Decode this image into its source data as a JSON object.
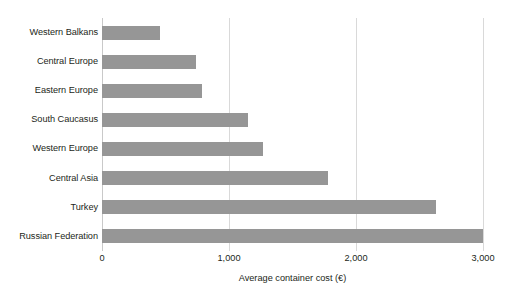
{
  "chart_data": {
    "type": "bar",
    "orientation": "horizontal",
    "title": "",
    "subtitle": "",
    "xlabel": "Average container cost (€)",
    "ylabel": "",
    "categories": [
      "Western Balkans",
      "Central Europe",
      "Eastern Europe",
      "South Caucasus",
      "Western Europe",
      "Central Asia",
      "Turkey",
      "Russian Federation"
    ],
    "values": [
      460,
      740,
      790,
      1150,
      1270,
      1780,
      2630,
      3000
    ],
    "xlim": [
      0,
      3000
    ],
    "xticks": [
      0,
      1000,
      2000,
      3000
    ],
    "xtick_labels": [
      "0",
      "1,000",
      "2,000",
      "3,000"
    ],
    "grid": "vertical",
    "legend": "none",
    "bar_color": "#969696",
    "gridline_color": "#d9d9d9",
    "background_color": "#ffffff",
    "text_color": "#231f20"
  }
}
